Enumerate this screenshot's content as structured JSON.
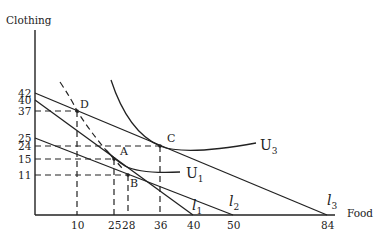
{
  "diagram": {
    "type": "budget-constraint-indifference-curves",
    "y_axis_title": "Clothing",
    "x_axis_title": "Food",
    "y_ticks": [
      {
        "label": "42",
        "value": 42,
        "py": 93
      },
      {
        "label": "40",
        "value": 40,
        "py": 100
      },
      {
        "label": "37",
        "value": 37,
        "py": 111
      },
      {
        "label": "25",
        "value": 25,
        "py": 138
      },
      {
        "label": "24",
        "value": 24,
        "py": 146
      },
      {
        "label": "15",
        "value": 15,
        "py": 159
      },
      {
        "label": "11",
        "value": 11,
        "py": 175
      }
    ],
    "x_ticks": [
      {
        "label": "10",
        "value": 10,
        "px": 77
      },
      {
        "label": "25",
        "value": 25,
        "px": 114
      },
      {
        "label": "28",
        "value": 28,
        "px": 128
      },
      {
        "label": "36",
        "value": 36,
        "px": 160
      },
      {
        "label": "40",
        "value": 40,
        "px": 193
      },
      {
        "label": "50",
        "value": 50,
        "px": 233
      },
      {
        "label": "84",
        "value": 84,
        "px": 327
      }
    ],
    "points": [
      {
        "label": "D",
        "food": 10,
        "clothing": 37
      },
      {
        "label": "A",
        "food": 25,
        "clothing": 15
      },
      {
        "label": "B",
        "food": 28,
        "clothing": 11
      },
      {
        "label": "C",
        "food": 36,
        "clothing": 24
      }
    ],
    "budget_lines": [
      {
        "label": "l",
        "subscript": "1",
        "y_intercept": 40,
        "x_intercept": 40
      },
      {
        "label": "l",
        "subscript": "2",
        "y_intercept": 25,
        "x_intercept": 50
      },
      {
        "label": "l",
        "subscript": "3",
        "y_intercept": 42,
        "x_intercept": 84
      }
    ],
    "indifference_curves": [
      {
        "label": "U",
        "subscript": "1"
      },
      {
        "label": "U",
        "subscript": "3"
      }
    ],
    "labels": {
      "D": "D",
      "A": "A",
      "B": "B",
      "C": "C",
      "U1": "U",
      "U1_sub": "1",
      "U3": "U",
      "U3_sub": "3",
      "l1": "l",
      "l1_sub": "1",
      "l2": "l",
      "l2_sub": "2",
      "l3": "l",
      "l3_sub": "3"
    }
  }
}
